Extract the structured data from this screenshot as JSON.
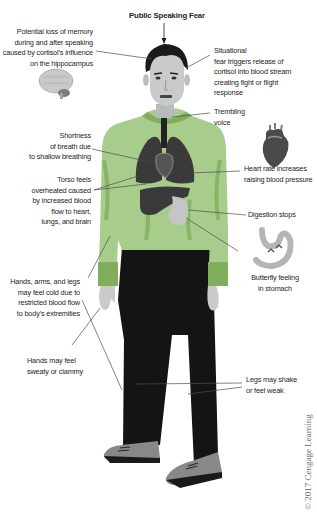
{
  "title": "Public Speaking Fear",
  "labels": {
    "memory": "Potential loss of memory\nduring  and after speaking\ncaused by cortisol’s influence\non the hippocampus",
    "situational": "Situational\nfear triggers release of\ncortisol into blood stream\ncreating fight or flight\nresponse",
    "voice": "Trembling\nvoice",
    "breath": "Shortness\nof breath due\nto shallow breathing",
    "heart": "Heart rate increases\nraising blood pressure",
    "torso": "Torso feels\noverheated caused\nby increased blood\nflow to heart,\nlungs, and brain",
    "digestion": "Digestion stops",
    "butterfly": "Butterfly feeling\nin stomach",
    "cold": "Hands, arms, and legs\nmay feel cold due to\nrestricted blood flow\nto body’s extremities",
    "sweaty": "Hands may feel\nsweaty or clammy",
    "legs": "Legs may shake\nor feel weak"
  },
  "icons": [
    "brain-icon",
    "heart-icon",
    "stomach-icon",
    "arrow-down-icon"
  ],
  "colors": {
    "shirt": "#a8cc8c",
    "shirt_shade": "#7fae5c",
    "pants": "#141414",
    "skin": "#c9cacc",
    "organs": "#3a3a3a",
    "shoes": "#8a8a8a",
    "leader_lines": "#4d4d4d"
  },
  "copyright": "© 2017 Cengage Learning"
}
